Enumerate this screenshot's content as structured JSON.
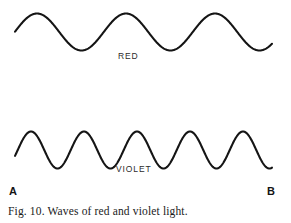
{
  "figure": {
    "caption": "Fig. 10.  Waves of red and violet light.",
    "background_color": "#ffffff",
    "stroke_color": "#151515",
    "endpoints": {
      "left_label": "A",
      "right_label": "B"
    },
    "waves": [
      {
        "name": "red",
        "label": "RED",
        "label_x": 118,
        "label_y": 52
      },
      {
        "name": "violet",
        "label": "VIOLET",
        "label_x": 116,
        "label_y": 165
      }
    ]
  },
  "chart_data": {
    "type": "line",
    "title": "Fig. 10.  Waves of red and violet light.",
    "subtitle": "",
    "xlabel": "",
    "ylabel": "",
    "grid": false,
    "legend_position": "inline",
    "axis_endpoints": {
      "left": "A",
      "right": "B"
    },
    "xlim": [
      15,
      272
    ],
    "ylim_red": [
      13,
      50
    ],
    "ylim_violet": [
      131,
      168
    ],
    "series": [
      {
        "name": "RED",
        "waveform": "sine",
        "midline_y": 32,
        "amplitude": 18.5,
        "wavelength": 89,
        "phase_start_x": 15,
        "phase_end_x": 272,
        "cycles": 2.9,
        "crest_x": [
          37,
          126,
          215
        ],
        "crest_y": 13,
        "trough_x": [
          82,
          171,
          259
        ],
        "trough_y": 50
      },
      {
        "name": "VIOLET",
        "waveform": "sine",
        "midline_y": 150,
        "amplitude": 18.5,
        "wavelength": 53,
        "phase_start_x": 15,
        "phase_end_x": 272,
        "cycles": 4.85,
        "crest_x": [
          31,
          84,
          137,
          190,
          243
        ],
        "crest_y": 131,
        "trough_x": [
          57,
          110,
          163,
          216
        ],
        "trough_y": 168
      }
    ],
    "annotations": [
      {
        "text": "RED",
        "x": 118,
        "y": 57
      },
      {
        "text": "VIOLET",
        "x": 116,
        "y": 170
      },
      {
        "text": "A",
        "x": 9,
        "y": 193
      },
      {
        "text": "B",
        "x": 267,
        "y": 193
      }
    ]
  }
}
